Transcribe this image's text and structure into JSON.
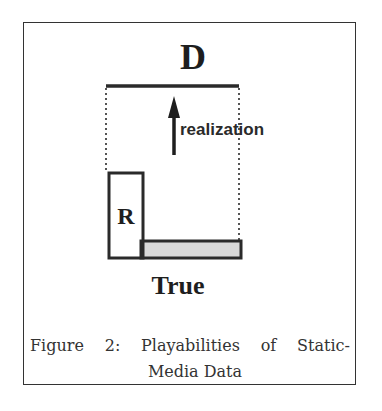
{
  "figure": {
    "label_top": "D",
    "label_box": "R",
    "label_bottom": "True",
    "arrow_label": "realization",
    "caption": {
      "line1_words": [
        "Figure",
        "2:",
        "Playabilities",
        "of",
        "Static-"
      ],
      "line2": "Media Data"
    },
    "colors": {
      "stroke": "#2a2a2a",
      "shaded_fill": "#d9d9d9",
      "frame": "#333333"
    }
  }
}
